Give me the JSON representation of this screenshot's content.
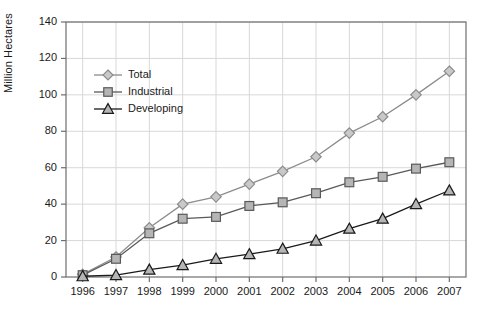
{
  "chart_data": {
    "type": "line",
    "title": "",
    "xlabel": "",
    "ylabel": "Million Hectares",
    "categories": [
      "1996",
      "1997",
      "1998",
      "1999",
      "2000",
      "2001",
      "2002",
      "2003",
      "2004",
      "2005",
      "2006",
      "2007"
    ],
    "x": [
      1996,
      1997,
      1998,
      1999,
      2000,
      2001,
      2002,
      2003,
      2004,
      2005,
      2006,
      2007
    ],
    "ylim": [
      0,
      140
    ],
    "yticks": [
      0,
      20,
      40,
      60,
      80,
      100,
      120,
      140
    ],
    "ytick_labels": [
      "0",
      "20",
      "40",
      "60",
      "80",
      "100",
      "120",
      "140"
    ],
    "grid": true,
    "legend_position": "upper left inside",
    "series": [
      {
        "name": "Total",
        "marker": "diamond",
        "color": "#8c8c8c",
        "marker_fill": "#c9c9c9",
        "values": [
          1.5,
          11,
          27,
          40,
          44,
          51,
          58,
          66,
          79,
          88,
          100,
          113
        ]
      },
      {
        "name": "Industrial",
        "marker": "square",
        "color": "#595959",
        "marker_fill": "#b5b5b5",
        "values": [
          1,
          10,
          24,
          32,
          33,
          39,
          41,
          46,
          52,
          55,
          59.5,
          63
        ]
      },
      {
        "name": "Developing",
        "marker": "triangle",
        "color": "#1a1a1a",
        "marker_fill": "#b5b5b5",
        "values": [
          0.4,
          1,
          4,
          6.5,
          10,
          12.5,
          15.5,
          20,
          26.5,
          32,
          40,
          47.5
        ]
      }
    ]
  },
  "axis": {
    "y_title": "Million Hectares"
  },
  "colors": {
    "frame": "#6e6e6e",
    "grid": "#d8d8d8",
    "text": "#1a1a1a",
    "background": "#ffffff"
  }
}
